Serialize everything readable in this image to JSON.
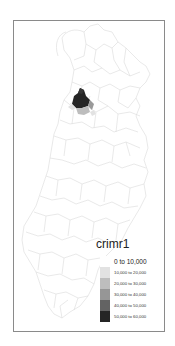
{
  "map": {
    "variable": "crimr1",
    "frame_border_color": "#8a8a8a",
    "boundary_color": "#dcdcdc",
    "highlight_cluster": {
      "classes_present": [
        "50,000 to 60,000",
        "40,000 to 50,000",
        "20,000 to 30,000",
        "10,000 to 20,000"
      ]
    }
  },
  "legend": {
    "title": "crimr1",
    "items": [
      {
        "label": "0 to 10,000",
        "color": "#ffffff"
      },
      {
        "label": "10,000 to 20,000",
        "color": "#e2e2e2"
      },
      {
        "label": "20,000 to 30,000",
        "color": "#bdbdbd"
      },
      {
        "label": "30,000 to 40,000",
        "color": "#969696"
      },
      {
        "label": "40,000 to 50,000",
        "color": "#636363"
      },
      {
        "label": "50,000 to 60,000",
        "color": "#252525"
      }
    ]
  }
}
